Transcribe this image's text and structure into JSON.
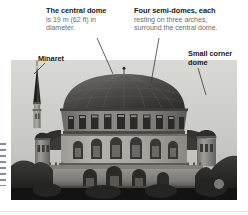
{
  "figure": {
    "labels": {
      "central_dome": {
        "heading": "The central dome",
        "body_line1": "is 19 m (62 ft) in",
        "body_line2": "diameter."
      },
      "semi_domes": {
        "heading": "Four semi-domes, each",
        "body_line1": "resting on three arches,",
        "body_line2": "surround the central dome."
      },
      "minaret": {
        "heading": "Minaret"
      },
      "corner_dome": {
        "heading_line1": "Small corner",
        "heading_line2": "dome"
      }
    },
    "colors": {
      "heading_text": "#1a1a1a",
      "body_text": "#6e6f71",
      "leader_line": "#3a3a3a",
      "page_background": "#ffffff"
    }
  }
}
